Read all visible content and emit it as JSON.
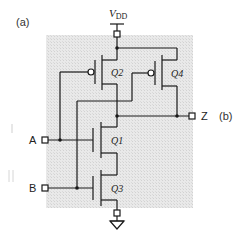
{
  "labels": {
    "panel_a": "(a)",
    "panel_b": "(b)",
    "vdd_main": "V",
    "vdd_sub": "DD",
    "input_a": "A",
    "input_b": "B",
    "output_z": "Z",
    "q1": "Q1",
    "q2": "Q2",
    "q3": "Q3",
    "q4": "Q4"
  },
  "colors": {
    "background": "#ffffff",
    "shaded_region": "#e6e6e6",
    "wire": "#1a1a1a",
    "label": "#222222",
    "faint_mark": "#c8c8c8"
  },
  "components": {
    "pmos": [
      "Q2",
      "Q4"
    ],
    "nmos": [
      "Q1",
      "Q3"
    ],
    "inputs": [
      "A",
      "B"
    ],
    "output": "Z",
    "supply": "VDD",
    "ground": "GND"
  }
}
